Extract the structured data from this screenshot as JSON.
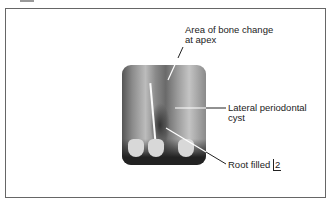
{
  "figure": {
    "annotations": [
      {
        "id": "bone-change",
        "text_line1": "Area of bone change",
        "text_line2": "at apex"
      },
      {
        "id": "lateral-cyst",
        "text_line1": "Lateral periodontal",
        "text_line2": "cyst"
      },
      {
        "id": "root-filled",
        "text_prefix": "Root filled ",
        "tooth_notation": "2"
      }
    ]
  }
}
